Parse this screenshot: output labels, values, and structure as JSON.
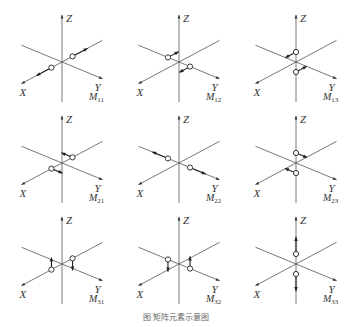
{
  "figure": {
    "caption": "图  矩阵元素示意图",
    "axis_labels": {
      "x": "X",
      "y": "Y",
      "z": "Z"
    },
    "line_color": "#555555",
    "panels": [
      {
        "id": "M11",
        "label_main": "M",
        "label_sub": "11",
        "row": 0,
        "col": 0,
        "points_on": "X",
        "arrows_along": "X",
        "arrow_dir": "outward"
      },
      {
        "id": "M12",
        "label_main": "M",
        "label_sub": "12",
        "row": 0,
        "col": 1,
        "points_on": "Y",
        "arrows_along": "X",
        "arrow_dir": "shear"
      },
      {
        "id": "M13",
        "label_main": "M",
        "label_sub": "13",
        "row": 0,
        "col": 2,
        "points_on": "Z",
        "arrows_along": "X",
        "arrow_dir": "shear"
      },
      {
        "id": "M21",
        "label_main": "M",
        "label_sub": "21",
        "row": 1,
        "col": 0,
        "points_on": "X",
        "arrows_along": "Y",
        "arrow_dir": "shear"
      },
      {
        "id": "M22",
        "label_main": "M",
        "label_sub": "22",
        "row": 1,
        "col": 1,
        "points_on": "Y",
        "arrows_along": "Y",
        "arrow_dir": "outward"
      },
      {
        "id": "M23",
        "label_main": "M",
        "label_sub": "23",
        "row": 1,
        "col": 2,
        "points_on": "Z",
        "arrows_along": "Y",
        "arrow_dir": "shear"
      },
      {
        "id": "M31",
        "label_main": "M",
        "label_sub": "31",
        "row": 2,
        "col": 0,
        "points_on": "X",
        "arrows_along": "Z",
        "arrow_dir": "shear"
      },
      {
        "id": "M32",
        "label_main": "M",
        "label_sub": "32",
        "row": 2,
        "col": 1,
        "points_on": "Y",
        "arrows_along": "Z",
        "arrow_dir": "shear"
      },
      {
        "id": "M33",
        "label_main": "M",
        "label_sub": "33",
        "row": 2,
        "col": 2,
        "points_on": "Z",
        "arrows_along": "Z",
        "arrow_dir": "outward"
      }
    ]
  }
}
